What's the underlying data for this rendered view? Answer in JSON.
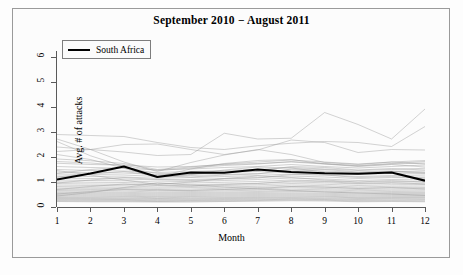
{
  "chart_data": {
    "type": "line",
    "title": "September 2010 − August 2011",
    "xlabel": "Month",
    "ylabel": "Avg. # of attacks",
    "xlim": [
      1,
      12
    ],
    "ylim": [
      0,
      6.4
    ],
    "x": [
      1,
      2,
      3,
      4,
      5,
      6,
      7,
      8,
      9,
      10,
      11,
      12
    ],
    "xticks": [
      "1",
      "2",
      "3",
      "4",
      "5",
      "6",
      "7",
      "8",
      "9",
      "10",
      "11",
      "12"
    ],
    "yticks": [
      "0",
      "1",
      "2",
      "3",
      "4",
      "5",
      "6"
    ],
    "grid": false,
    "legend": {
      "position": "top-left",
      "entries": [
        "South Africa"
      ]
    },
    "highlight_color": "#000000",
    "background_color": "#fcfcfc",
    "series_color": "#9a9a9a",
    "series": [
      {
        "name": "South Africa",
        "highlight": true,
        "values": [
          1.1,
          1.34,
          1.62,
          1.2,
          1.38,
          1.37,
          1.5,
          1.4,
          1.35,
          1.33,
          1.38,
          1.05
        ]
      },
      {
        "name": "country-01",
        "values": [
          2.9,
          2.86,
          2.82,
          2.58,
          2.38,
          2.3,
          2.45,
          2.55,
          2.62,
          2.58,
          2.42,
          3.22
        ]
      },
      {
        "name": "country-02",
        "values": [
          2.4,
          2.3,
          2.2,
          2.06,
          2.1,
          2.95,
          2.72,
          2.75,
          3.78,
          3.3,
          2.72,
          3.92
        ]
      },
      {
        "name": "country-03",
        "values": [
          2.22,
          2.3,
          2.5,
          2.52,
          2.3,
          2.1,
          2.28,
          2.68,
          2.58,
          2.18,
          2.3,
          2.28
        ]
      },
      {
        "name": "country-04",
        "values": [
          2.72,
          2.3,
          1.8,
          1.42,
          1.78,
          2.08,
          2.3,
          2.1,
          1.78,
          1.7,
          1.8,
          1.72
        ]
      },
      {
        "name": "country-05",
        "values": [
          2.62,
          2.05,
          1.62,
          1.22,
          1.52,
          1.74,
          1.86,
          1.9,
          1.72,
          1.62,
          1.7,
          1.6
        ]
      },
      {
        "name": "country-06",
        "values": [
          1.75,
          1.7,
          1.68,
          1.6,
          1.62,
          1.7,
          1.74,
          1.8,
          1.72,
          1.66,
          1.74,
          1.82
        ]
      },
      {
        "name": "country-07",
        "values": [
          1.62,
          1.58,
          1.55,
          1.48,
          1.52,
          1.58,
          1.62,
          1.7,
          1.62,
          1.56,
          1.62,
          1.68
        ]
      },
      {
        "name": "country-08",
        "values": [
          1.5,
          1.46,
          1.44,
          1.38,
          1.42,
          1.46,
          1.5,
          1.58,
          1.52,
          1.46,
          1.5,
          1.55
        ]
      },
      {
        "name": "country-09",
        "values": [
          1.4,
          1.38,
          1.36,
          1.3,
          1.34,
          1.38,
          1.42,
          1.48,
          1.44,
          1.38,
          1.42,
          1.44
        ]
      },
      {
        "name": "country-10",
        "values": [
          1.32,
          1.3,
          1.28,
          1.22,
          1.26,
          1.3,
          1.34,
          1.4,
          1.36,
          1.3,
          1.34,
          1.36
        ]
      },
      {
        "name": "country-11",
        "values": [
          1.24,
          1.22,
          1.2,
          1.15,
          1.18,
          1.22,
          1.26,
          1.32,
          1.28,
          1.22,
          1.26,
          1.28
        ]
      },
      {
        "name": "country-12",
        "values": [
          1.16,
          1.14,
          1.12,
          1.08,
          1.1,
          1.14,
          1.18,
          1.24,
          1.2,
          1.14,
          1.18,
          1.2
        ]
      },
      {
        "name": "country-13",
        "values": [
          1.08,
          1.06,
          1.05,
          1.0,
          1.03,
          1.06,
          1.1,
          1.16,
          1.12,
          1.06,
          1.1,
          1.12
        ]
      },
      {
        "name": "country-14",
        "values": [
          1.0,
          0.99,
          0.98,
          0.93,
          0.96,
          0.99,
          1.02,
          1.08,
          1.04,
          0.99,
          1.02,
          1.04
        ]
      },
      {
        "name": "country-15",
        "values": [
          0.94,
          0.92,
          0.91,
          0.86,
          0.89,
          0.92,
          0.95,
          1.0,
          0.97,
          0.92,
          0.95,
          0.96
        ]
      },
      {
        "name": "country-16",
        "values": [
          0.88,
          0.86,
          0.85,
          0.8,
          0.83,
          0.86,
          0.89,
          0.94,
          0.91,
          0.86,
          0.89,
          0.9
        ]
      },
      {
        "name": "country-17",
        "values": [
          0.82,
          0.8,
          0.79,
          0.75,
          0.78,
          0.8,
          0.83,
          0.88,
          0.85,
          0.8,
          0.83,
          0.84
        ]
      },
      {
        "name": "country-18",
        "values": [
          0.76,
          0.75,
          0.74,
          0.7,
          0.72,
          0.75,
          0.78,
          0.82,
          0.79,
          0.75,
          0.77,
          0.78
        ]
      },
      {
        "name": "country-19",
        "values": [
          0.71,
          0.7,
          0.69,
          0.65,
          0.67,
          0.7,
          0.72,
          0.77,
          0.74,
          0.7,
          0.72,
          0.73
        ]
      },
      {
        "name": "country-20",
        "values": [
          0.66,
          0.65,
          0.64,
          0.6,
          0.62,
          0.65,
          0.67,
          0.71,
          0.69,
          0.65,
          0.67,
          0.68
        ]
      },
      {
        "name": "country-21",
        "values": [
          0.61,
          0.6,
          0.59,
          0.56,
          0.58,
          0.6,
          0.62,
          0.66,
          0.64,
          0.6,
          0.62,
          0.63
        ]
      },
      {
        "name": "country-22",
        "values": [
          0.57,
          0.56,
          0.55,
          0.52,
          0.54,
          0.56,
          0.58,
          0.62,
          0.6,
          0.56,
          0.58,
          0.58
        ]
      },
      {
        "name": "country-23",
        "values": [
          0.53,
          0.52,
          0.51,
          0.48,
          0.5,
          0.52,
          0.54,
          0.57,
          0.55,
          0.52,
          0.54,
          0.54
        ]
      },
      {
        "name": "country-24",
        "values": [
          0.49,
          0.48,
          0.47,
          0.44,
          0.46,
          0.48,
          0.5,
          0.53,
          0.51,
          0.48,
          0.5,
          0.5
        ]
      },
      {
        "name": "country-25",
        "values": [
          0.45,
          0.44,
          0.43,
          0.41,
          0.42,
          0.44,
          0.46,
          0.49,
          0.47,
          0.44,
          0.46,
          0.46
        ]
      },
      {
        "name": "country-26",
        "values": [
          0.41,
          0.4,
          0.4,
          0.37,
          0.39,
          0.4,
          0.42,
          0.45,
          0.43,
          0.4,
          0.42,
          0.42
        ]
      },
      {
        "name": "country-27",
        "values": [
          0.38,
          0.37,
          0.36,
          0.34,
          0.35,
          0.37,
          0.38,
          0.41,
          0.4,
          0.37,
          0.38,
          0.38
        ]
      },
      {
        "name": "country-28",
        "values": [
          0.34,
          0.34,
          0.33,
          0.31,
          0.32,
          0.34,
          0.35,
          0.38,
          0.36,
          0.34,
          0.35,
          0.35
        ]
      },
      {
        "name": "country-29",
        "values": [
          0.31,
          0.3,
          0.3,
          0.28,
          0.29,
          0.3,
          0.32,
          0.34,
          0.33,
          0.3,
          0.32,
          0.31
        ]
      },
      {
        "name": "country-30",
        "values": [
          0.28,
          0.27,
          0.27,
          0.25,
          0.26,
          0.27,
          0.29,
          0.31,
          0.3,
          0.27,
          0.28,
          0.28
        ]
      },
      {
        "name": "country-31",
        "values": [
          0.25,
          0.24,
          0.24,
          0.22,
          0.23,
          0.24,
          0.26,
          0.28,
          0.27,
          0.24,
          0.25,
          0.24
        ]
      },
      {
        "name": "country-32",
        "values": [
          0.22,
          0.21,
          0.21,
          0.2,
          0.2,
          0.22,
          0.23,
          0.25,
          0.24,
          0.21,
          0.22,
          0.21
        ]
      },
      {
        "name": "country-33",
        "values": [
          1.92,
          1.85,
          1.74,
          1.5,
          1.6,
          1.72,
          1.8,
          1.88,
          1.8,
          1.72,
          1.8,
          1.86
        ]
      },
      {
        "name": "country-34",
        "values": [
          1.82,
          1.76,
          1.66,
          1.46,
          1.56,
          1.66,
          1.72,
          1.82,
          1.74,
          1.64,
          1.72,
          1.76
        ]
      },
      {
        "name": "country-35",
        "values": [
          1.34,
          1.5,
          1.58,
          1.34,
          1.3,
          1.4,
          1.44,
          1.62,
          1.58,
          1.48,
          1.54,
          1.48
        ]
      },
      {
        "name": "country-36",
        "values": [
          1.2,
          1.32,
          1.42,
          1.26,
          1.2,
          1.28,
          1.32,
          1.52,
          1.5,
          1.4,
          1.44,
          1.38
        ]
      },
      {
        "name": "country-37",
        "values": [
          0.96,
          1.08,
          1.18,
          1.1,
          1.06,
          1.12,
          1.16,
          1.3,
          1.28,
          1.18,
          1.22,
          1.16
        ]
      },
      {
        "name": "country-38",
        "values": [
          0.7,
          0.82,
          0.92,
          0.88,
          0.84,
          0.9,
          0.94,
          1.04,
          1.02,
          0.94,
          0.98,
          0.92
        ]
      },
      {
        "name": "country-39",
        "values": [
          0.52,
          0.62,
          0.7,
          0.68,
          0.66,
          0.7,
          0.74,
          0.82,
          0.8,
          0.74,
          0.78,
          0.72
        ]
      },
      {
        "name": "country-40",
        "values": [
          2.1,
          1.9,
          1.55,
          1.18,
          1.3,
          1.48,
          1.6,
          1.56,
          1.4,
          1.32,
          1.42,
          1.34
        ]
      },
      {
        "name": "country-41",
        "values": [
          0.44,
          0.58,
          0.78,
          0.96,
          0.88,
          0.8,
          0.72,
          0.66,
          0.6,
          0.56,
          0.52,
          0.46
        ]
      },
      {
        "name": "country-42",
        "values": [
          1.46,
          1.28,
          1.08,
          0.9,
          1.0,
          1.14,
          1.24,
          1.18,
          1.08,
          1.0,
          1.06,
          1.0
        ]
      }
    ]
  }
}
